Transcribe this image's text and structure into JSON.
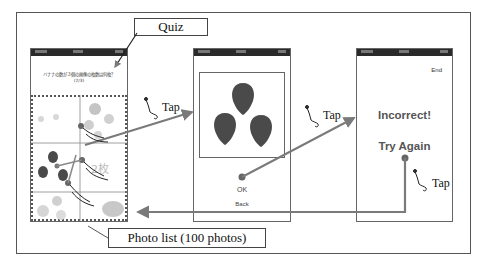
{
  "callouts": {
    "quiz": "Quiz",
    "photo_list": "Photo list (100 photos)"
  },
  "gestures": {
    "tap1": "Tap",
    "tap2": "Tap",
    "tap3": "Tap"
  },
  "screen1": {
    "question": "バナナの数が３個の画像の枚数は何枚？",
    "progress": "(2/3)",
    "grid_overlay": "2枚",
    "grid": {
      "rows": 3,
      "cols": 2
    }
  },
  "screen2": {
    "image_content": "3 strawberries",
    "ok_label": "OK",
    "back_label": "Back"
  },
  "screen3": {
    "end_label": "End",
    "result": "Incorrect!",
    "retry_label": "Try Again"
  },
  "colors": {
    "arrow": "#7a7a7a",
    "fruit": "#4a4a4a",
    "faded_fruit": "#c8c8c8",
    "statusbar": "#2a2a2a",
    "frame": "#555555"
  }
}
